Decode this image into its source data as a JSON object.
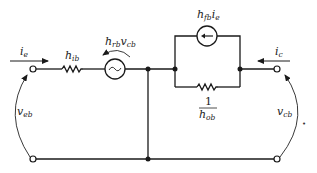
{
  "diagram": {
    "type": "circuit",
    "colors": {
      "line": "#1a1a1a",
      "background": "#ffffff"
    },
    "labels": {
      "input_current": {
        "main": "i",
        "sub": "e"
      },
      "input_resistance": {
        "main": "h",
        "sub": "ib"
      },
      "reverse_source": {
        "main": "h",
        "sub": "rb",
        "main2": "v",
        "sub2": "cb"
      },
      "forward_source": {
        "main": "h",
        "sub": "fb",
        "main2": "i",
        "sub2": "e"
      },
      "output_current": {
        "main": "i",
        "sub": "c"
      },
      "output_conductance_num": "1",
      "output_conductance_den": {
        "main": "h",
        "sub": "ob"
      },
      "input_voltage": {
        "main": "v",
        "sub": "eb"
      },
      "output_voltage": {
        "main": "v",
        "sub": "cb"
      },
      "stray_mark": "•"
    },
    "components": [
      {
        "id": "h_ib",
        "kind": "resistor",
        "position": "series input"
      },
      {
        "id": "h_rb_v_cb",
        "kind": "ac-voltage-source",
        "symbol": "~"
      },
      {
        "id": "h_fb_i_e",
        "kind": "current-source",
        "direction": "left"
      },
      {
        "id": "1_over_h_ob",
        "kind": "resistor",
        "position": "parallel with current source"
      }
    ],
    "terminals": [
      "input-top",
      "input-bottom",
      "output-top",
      "output-bottom"
    ]
  }
}
